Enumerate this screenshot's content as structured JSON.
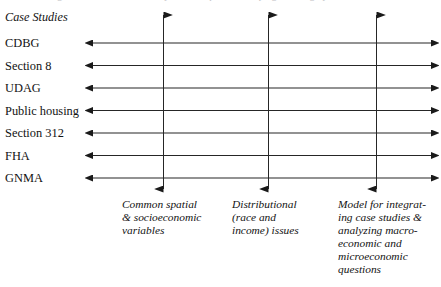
{
  "figure": {
    "caption_clipped": "FIGURE 1. Organization of case studies by research question and program category",
    "background_color": "#ffffff",
    "line_color": "#1a1a1a"
  },
  "rows": {
    "heading": "Case Studies",
    "items": [
      {
        "label": "CDBG"
      },
      {
        "label": "Section 8"
      },
      {
        "label": "UDAG"
      },
      {
        "label": "Public housing"
      },
      {
        "label": "Section 312"
      },
      {
        "label": "FHA"
      },
      {
        "label": "GNMA"
      }
    ]
  },
  "columns": [
    {
      "lines": [
        "Common spatial",
        "& socioeconomic",
        "variables"
      ]
    },
    {
      "lines": [
        "Distributional",
        "(race and",
        "income) issues"
      ]
    },
    {
      "lines": [
        "Model for integrat-",
        "ing case studies &",
        "analyzing macro-",
        "economic and",
        "microeconomic",
        "questions"
      ]
    }
  ]
}
